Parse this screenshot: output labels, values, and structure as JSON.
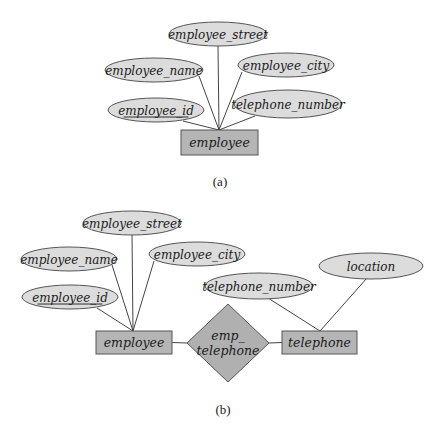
{
  "colors": {
    "attribute_fill": "#dcdcdc",
    "entity_fill": "#b5b5b5",
    "relationship_fill": "#b0b0b0",
    "stroke": "#555555",
    "line": "#444444"
  },
  "diagram_a": {
    "caption": "(a)",
    "entity": {
      "label": "employee",
      "x": 181,
      "y": 130,
      "w": 77,
      "h": 25
    },
    "anchor": {
      "x": 219,
      "y": 130
    },
    "attributes": [
      {
        "label": "employee_street",
        "cx": 218,
        "cy": 34,
        "rx": 49,
        "ry": 12,
        "key": false,
        "lx": 218,
        "ly": 46
      },
      {
        "label": "employee_name",
        "cx": 154,
        "cy": 70,
        "rx": 49,
        "ry": 12,
        "key": false,
        "lx": 199,
        "ly": 76
      },
      {
        "label": "employee_city",
        "cx": 286,
        "cy": 65,
        "rx": 48,
        "ry": 12,
        "key": false,
        "lx": 242,
        "ly": 72
      },
      {
        "label": "employee_id",
        "cx": 156,
        "cy": 110,
        "rx": 48,
        "ry": 12,
        "key": true,
        "lx": 183,
        "ly": 121
      },
      {
        "label": "telephone_number",
        "cx": 288,
        "cy": 104,
        "rx": 54,
        "ry": 14,
        "key": false,
        "lx": 255,
        "ly": 116
      }
    ]
  },
  "diagram_b": {
    "caption": "(b)",
    "entities": [
      {
        "label": "employee",
        "x": 96,
        "y": 331,
        "w": 76,
        "h": 23
      },
      {
        "label": "telephone",
        "x": 282,
        "y": 331,
        "w": 75,
        "h": 23
      }
    ],
    "relationship": {
      "label_line1": "emp_",
      "label_line2": "telephone",
      "cx": 228,
      "cy": 343,
      "hw": 41,
      "hh": 39
    },
    "employee_anchor": {
      "x": 133,
      "y": 331
    },
    "telephone_anchor": {
      "x": 320,
      "y": 331
    },
    "employee_attributes": [
      {
        "label": "employee_street",
        "cx": 132,
        "cy": 223,
        "rx": 49,
        "ry": 12,
        "key": false,
        "lx": 132,
        "ly": 235
      },
      {
        "label": "employee_name",
        "cx": 69,
        "cy": 259,
        "rx": 48,
        "ry": 12,
        "key": false,
        "lx": 112,
        "ly": 265
      },
      {
        "label": "employee_city",
        "cx": 197,
        "cy": 254,
        "rx": 48,
        "ry": 12,
        "key": false,
        "lx": 154,
        "ly": 261
      },
      {
        "label": "employee_id",
        "cx": 70,
        "cy": 297,
        "rx": 48,
        "ry": 12,
        "key": true,
        "lx": 97,
        "ly": 308
      }
    ],
    "telephone_attributes": [
      {
        "label": "telephone_number",
        "cx": 259,
        "cy": 286,
        "rx": 54,
        "ry": 13,
        "key": false,
        "lx": 268,
        "ly": 298
      },
      {
        "label": "location",
        "cx": 371,
        "cy": 266,
        "rx": 52,
        "ry": 13,
        "key": false,
        "lx": 367,
        "ly": 278
      }
    ]
  }
}
